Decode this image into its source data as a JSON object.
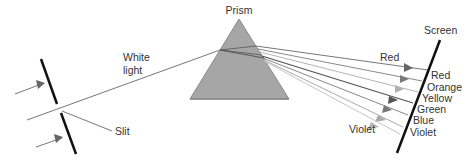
{
  "diagram": {
    "labels": {
      "prism": "Prism",
      "screen": "Screen",
      "white_light_line1": "White",
      "white_light_line2": "light",
      "slit": "Slit",
      "red_ray": "Red",
      "violet_ray": "Violet"
    },
    "spectrum": [
      "Red",
      "Orange",
      "Yellow",
      "Green",
      "Blue",
      "Violet"
    ],
    "colors": {
      "prism_fill": "#a6a6a6",
      "prism_edge": "#8a8a8a",
      "barrier": "#111111",
      "screen": "#111111",
      "ray_dark": "#555555",
      "ray_mid": "#808080",
      "ray_light": "#b0b0b0",
      "arrow_left": "#666666"
    }
  }
}
